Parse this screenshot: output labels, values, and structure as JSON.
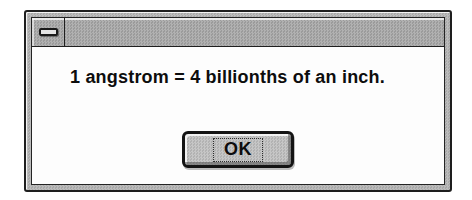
{
  "window": {
    "type": "message-dialog",
    "titlebar": {
      "title": "",
      "control_menu_icon": "dash-icon"
    }
  },
  "dialog": {
    "message": "1 angstrom = 4 billionths of an inch.",
    "buttons": [
      {
        "label": "OK",
        "default": true,
        "focused": true
      }
    ]
  },
  "colors": {
    "page_background": "#ffffff",
    "frame_gray": "#b4b4b4",
    "titlebar_gray": "#a6a6a6",
    "client_white": "#fdfdfd",
    "button_face": "#bdbdbd",
    "border_black": "#1e1e1e",
    "text_black": "#0d0d0d"
  }
}
